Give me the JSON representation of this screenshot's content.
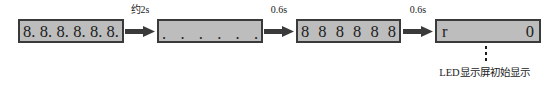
{
  "diagram": {
    "caption": "LED显示屏初始显示",
    "colors": {
      "box_fill": "#bdbdbd",
      "box_border": "#3a3a3a",
      "text": "#1c1c1c",
      "arrow": "#3a3a3a",
      "background": "#ffffff"
    },
    "steps": [
      {
        "id": "step-1",
        "name": "all-segments-with-dots",
        "segments": [
          "8.",
          "8.",
          "8.",
          "8.",
          "8.",
          "8."
        ]
      },
      {
        "id": "step-2",
        "name": "decimal-points-only",
        "segments": [
          ".",
          ".",
          ".",
          ".",
          ".",
          "."
        ]
      },
      {
        "id": "step-3",
        "name": "all-eights-no-dots",
        "segments": [
          "8",
          "8",
          "8",
          "8",
          "8",
          "8"
        ]
      },
      {
        "id": "step-4",
        "name": "initial-reading",
        "segments": [
          "r",
          "0"
        ]
      }
    ],
    "transitions": [
      {
        "id": "transition-1",
        "label": "约2s"
      },
      {
        "id": "transition-2",
        "label": "0.6s"
      },
      {
        "id": "transition-3",
        "label": "0.6s"
      }
    ]
  }
}
